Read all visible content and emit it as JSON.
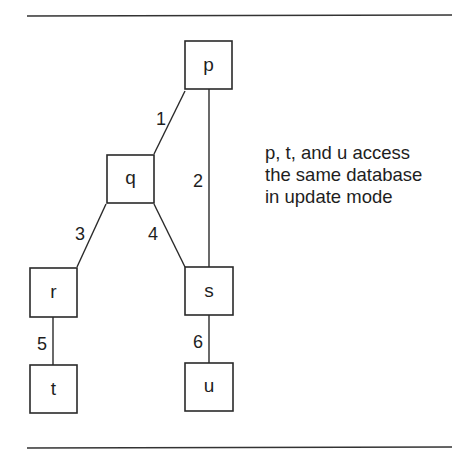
{
  "diagram": {
    "nodes": [
      {
        "id": "p",
        "label": "p",
        "x": 185,
        "y": 41,
        "w": 47,
        "h": 48
      },
      {
        "id": "q",
        "label": "q",
        "x": 107,
        "y": 155,
        "w": 47,
        "h": 48
      },
      {
        "id": "r",
        "label": "r",
        "x": 30,
        "y": 268,
        "w": 47,
        "h": 49
      },
      {
        "id": "s",
        "label": "s",
        "x": 185,
        "y": 267,
        "w": 48,
        "h": 48
      },
      {
        "id": "t",
        "label": "t",
        "x": 30,
        "y": 365,
        "w": 47,
        "h": 48
      },
      {
        "id": "u",
        "label": "u",
        "x": 185,
        "y": 363,
        "w": 48,
        "h": 48
      }
    ],
    "edges": [
      {
        "id": "1",
        "label": "1",
        "from": "p",
        "to": "q"
      },
      {
        "id": "2",
        "label": "2",
        "from": "p",
        "to": "s"
      },
      {
        "id": "3",
        "label": "3",
        "from": "q",
        "to": "r"
      },
      {
        "id": "4",
        "label": "4",
        "from": "q",
        "to": "s"
      },
      {
        "id": "5",
        "label": "5",
        "from": "r",
        "to": "t"
      },
      {
        "id": "6",
        "label": "6",
        "from": "s",
        "to": "u"
      }
    ],
    "note": {
      "lines": [
        "p, t, and u access",
        "the same database",
        "in update mode"
      ]
    }
  }
}
